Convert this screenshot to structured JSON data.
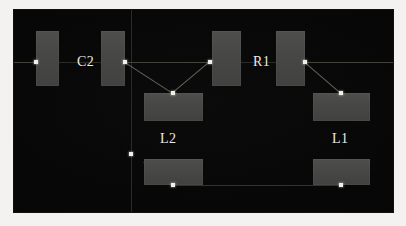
{
  "viewer": {
    "name": "pcb-layout-canvas",
    "background_color": "#070707",
    "frame_color": "#f3f2f0",
    "pad_color": "#474746",
    "node_color": "#f0efe8",
    "trace_color": "#6e6c63",
    "guide_color": "#2a2a28",
    "canvas": {
      "x": 13,
      "y": 9,
      "width": 381,
      "height": 204
    }
  },
  "guides": [
    {
      "name": "vertical-guide",
      "orientation": "v",
      "x": 117,
      "y": 0,
      "length": 204
    },
    {
      "name": "horizontal-guide",
      "orientation": "h",
      "x": 0,
      "y": 52,
      "length": 381
    }
  ],
  "components": [
    {
      "refdes": "C2",
      "type": "capacitor",
      "label_x": 63,
      "label_y": 45,
      "pads": [
        {
          "name": "pad-c2-1",
          "x": 22,
          "y": 21,
          "w": 23,
          "h": 55
        },
        {
          "name": "pad-c2-2",
          "x": 87,
          "y": 21,
          "w": 24,
          "h": 55
        }
      ]
    },
    {
      "refdes": "R1",
      "type": "resistor",
      "label_x": 239,
      "label_y": 45,
      "pads": [
        {
          "name": "pad-r1-1",
          "x": 198,
          "y": 21,
          "w": 29,
          "h": 55
        },
        {
          "name": "pad-r1-2",
          "x": 262,
          "y": 21,
          "w": 29,
          "h": 55
        }
      ]
    },
    {
      "refdes": "L2",
      "type": "inductor",
      "label_x": 146,
      "label_y": 122,
      "pads": [
        {
          "name": "pad-l2-1",
          "x": 130,
          "y": 83,
          "w": 59,
          "h": 28
        },
        {
          "name": "pad-l2-2",
          "x": 130,
          "y": 149,
          "w": 59,
          "h": 26
        }
      ]
    },
    {
      "refdes": "L1",
      "type": "inductor",
      "label_x": 318,
      "label_y": 122,
      "pads": [
        {
          "name": "pad-l1-1",
          "x": 299,
          "y": 83,
          "w": 57,
          "h": 28
        },
        {
          "name": "pad-l1-2",
          "x": 299,
          "y": 149,
          "w": 57,
          "h": 26
        }
      ]
    }
  ],
  "nodes": [
    {
      "name": "node-c2-1",
      "x": 22,
      "y": 52
    },
    {
      "name": "node-c2-2",
      "x": 111,
      "y": 52
    },
    {
      "name": "node-r1-1",
      "x": 196,
      "y": 52
    },
    {
      "name": "node-r1-2",
      "x": 291,
      "y": 52
    },
    {
      "name": "node-l2-top",
      "x": 159,
      "y": 83
    },
    {
      "name": "node-l2-bottom",
      "x": 159,
      "y": 175
    },
    {
      "name": "node-l1-top",
      "x": 327,
      "y": 83
    },
    {
      "name": "node-l1-bottom",
      "x": 327,
      "y": 175
    },
    {
      "name": "node-left-mid",
      "x": 117,
      "y": 144
    }
  ],
  "traces": [
    {
      "name": "trace-c2-1-west",
      "x1": 0,
      "y1": 52,
      "x2": 22,
      "y2": 52,
      "style": "dim"
    },
    {
      "name": "trace-c2-2-to-r1-1",
      "x1": 111,
      "y1": 52,
      "x2": 196,
      "y2": 52,
      "style": "dim"
    },
    {
      "name": "trace-c2-2-to-l2-top",
      "x1": 111,
      "y1": 52,
      "x2": 159,
      "y2": 83,
      "style": "bright"
    },
    {
      "name": "trace-r1-1-to-l2-top",
      "x1": 196,
      "y1": 52,
      "x2": 159,
      "y2": 83,
      "style": "bright"
    },
    {
      "name": "trace-r1-2-east",
      "x1": 291,
      "y1": 52,
      "x2": 381,
      "y2": 52,
      "style": "dim"
    },
    {
      "name": "trace-r1-2-to-l1-top",
      "x1": 291,
      "y1": 52,
      "x2": 327,
      "y2": 83,
      "style": "bright"
    },
    {
      "name": "trace-l2-pad-diagonal",
      "x1": 130,
      "y1": 152,
      "x2": 159,
      "y2": 175,
      "style": "bright"
    },
    {
      "name": "trace-l2-bottom-to-l1-bottom",
      "x1": 159,
      "y1": 175,
      "x2": 327,
      "y2": 175,
      "style": "dim"
    }
  ]
}
